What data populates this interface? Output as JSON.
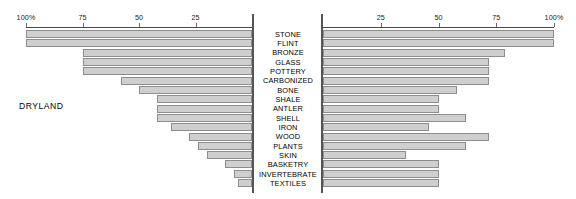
{
  "chart_data": {
    "type": "bar",
    "title": "",
    "subtitle": "",
    "orientation": "horizontal",
    "layout": "back-to-back diverging pair with shared centre category axis",
    "xlabel": "",
    "ylabel": "",
    "grid": false,
    "legend": "none",
    "categories": [
      "STONE",
      "FLINT",
      "BRONZE",
      "GLASS",
      "POTTERY",
      "CARBONIZED",
      "BONE",
      "SHALE",
      "ANTLER",
      "SHELL",
      "IRON",
      "WOOD",
      "PLANTS",
      "SKIN",
      "BASKETRY",
      "INVERTEBRATE",
      "TEXTILES"
    ],
    "units": "percent",
    "axis_ticks": [
      100,
      75,
      50,
      25
    ],
    "axis_tick_labels": [
      "100%",
      "75",
      "50",
      "25"
    ],
    "xlim": [
      0,
      100
    ],
    "series": [
      {
        "name": "DRYLAND",
        "side": "left",
        "direction": "right-to-left",
        "axis_tick_labels": [
          "100%",
          "75",
          "50",
          "25"
        ],
        "values": [
          100,
          100,
          75,
          75,
          75,
          58,
          50,
          42,
          42,
          42,
          36,
          28,
          24,
          20,
          12,
          8,
          6
        ]
      },
      {
        "name": "WETLAND",
        "side": "right",
        "direction": "left-to-right",
        "axis_tick_labels": [
          "25",
          "50",
          "75",
          "100%"
        ],
        "values": [
          100,
          100,
          79,
          72,
          72,
          72,
          58,
          50,
          50,
          62,
          46,
          72,
          62,
          36,
          50,
          50,
          50
        ]
      }
    ]
  },
  "panels": {
    "left": {
      "caption": "DRYLAND"
    },
    "right": {
      "caption": "WETLAND"
    }
  }
}
